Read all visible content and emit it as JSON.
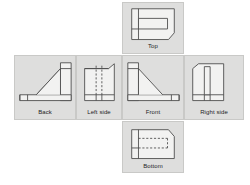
{
  "figure": {
    "kind": "orthographic-projection-unfolded-box",
    "background_color": "#ffffff",
    "panel_fill": "#dededd",
    "panel_border_color": "#c9c9c7",
    "line_color": "#4a4a4a",
    "hidden_line_color": "#4a4a4a",
    "part_fill": "#f2f2f1"
  },
  "views": {
    "top": {
      "label": "Top",
      "description": "Top view: rectangular outline with chamfered lower-right corner, a horizontal slot rectangle in the middle and a short vertical divider near the left edge.",
      "hidden_lines": false
    },
    "back": {
      "label": "Back",
      "description": "Back view: L-shaped bracket with a diagonal web running from the upper-right block down to the lower-left foot.",
      "hidden_lines": false
    },
    "left_side": {
      "label": "Left side",
      "description": "Left side view: rectangular outline with chamfered upper-right corner, a vertical dashed hidden slot in the centre and a horizontal base band.",
      "hidden_lines": true
    },
    "front": {
      "label": "Front",
      "description": "Front view: L-shaped bracket with a diagonal web running from the upper-left block down to the lower-right foot.",
      "hidden_lines": false
    },
    "right_side": {
      "label": "Right side",
      "description": "Right side view: rectangular outline with chamfered upper-left corner, a visible vertical slot drawn with solid lines and a horizontal base band.",
      "hidden_lines": false
    },
    "bottom": {
      "label": "Bottom",
      "description": "Bottom view: rectangular outline with chamfered upper-right corner, a vertical divider near the left edge and two horizontal dashed hidden lines forming a slot.",
      "hidden_lines": true
    }
  }
}
